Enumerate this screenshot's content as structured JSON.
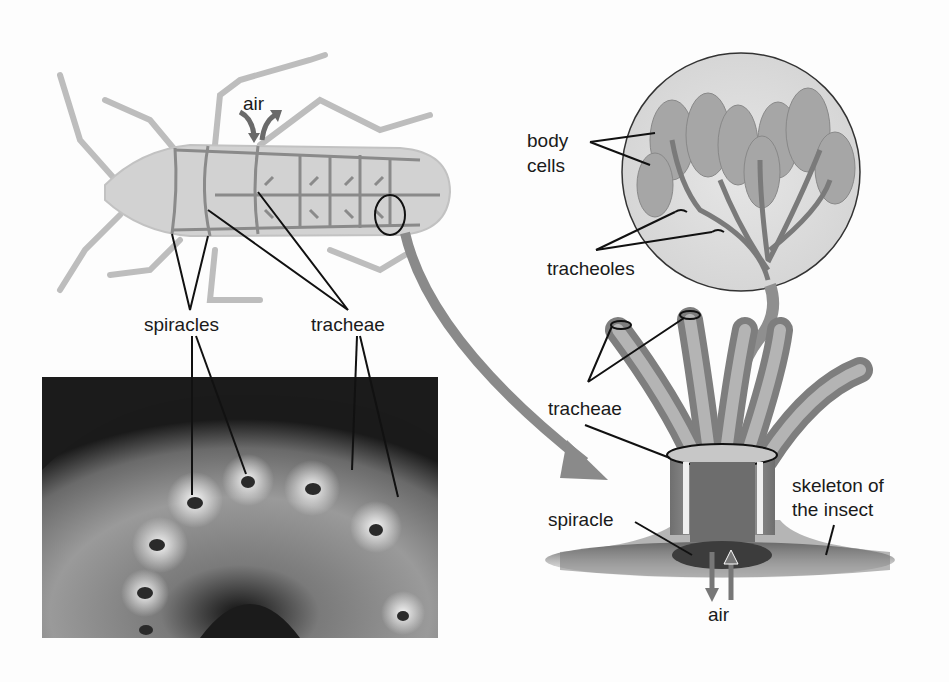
{
  "diagram": {
    "labels": {
      "air_top": "air",
      "spiracles": "spiracles",
      "tracheae_left": "tracheae",
      "body_cells_line1": "body",
      "body_cells_line2": "cells",
      "tracheoles": "tracheoles",
      "tracheae_right": "tracheae",
      "skeleton_line1": "skeleton of",
      "skeleton_line2": "the insect",
      "spiracle": "spiracle",
      "air_bottom": "air"
    },
    "panels": [
      {
        "id": "insect-drawing",
        "description": "Top view of insect body showing network of tracheae and spiracles"
      },
      {
        "id": "caterpillar-photo",
        "description": "Micrograph of caterpillar body segments showing spiracles and tracheae"
      },
      {
        "id": "magnified-view",
        "description": "Enlarged view of tracheae branching into tracheoles that reach body cells, opening through a spiracle in the skeleton"
      }
    ],
    "colors": {
      "background": "#fdfdfd",
      "line": "#111111",
      "body_fill": "#d2d2d2",
      "trachea": "#8a8a8a",
      "photo_dark": "#1b1b1b"
    }
  }
}
